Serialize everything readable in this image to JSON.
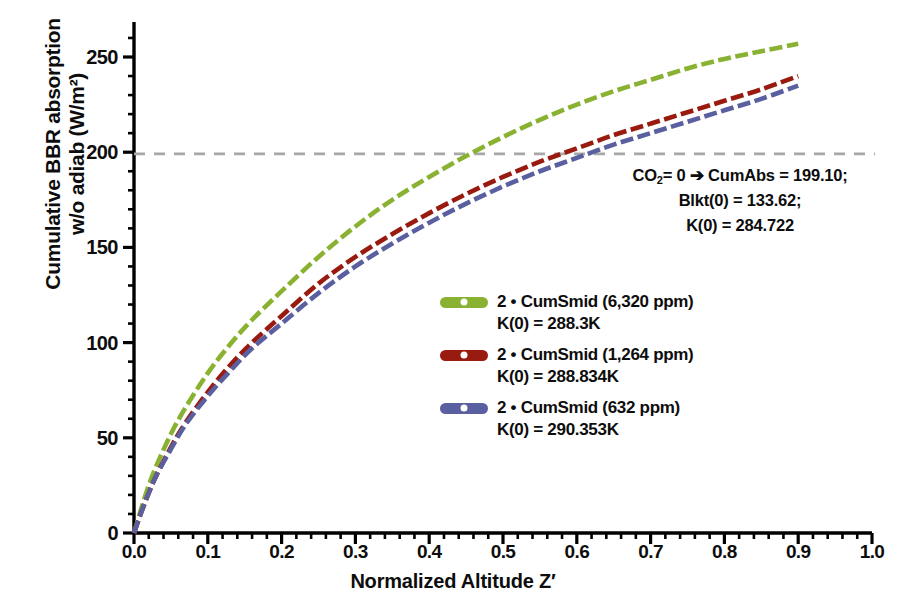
{
  "chart_data": {
    "type": "line",
    "title": "",
    "xlabel": "Normalized Altitude Z′",
    "ylabel_line1": "Cumulative BBR absorption",
    "ylabel_line2": "w/o adiab (W/m²)",
    "xlim": [
      0.0,
      1.0
    ],
    "ylim": [
      0,
      262
    ],
    "grid": false,
    "legend_position": "center",
    "xticks": [
      "0.0",
      "0.1",
      "0.2",
      "0.3",
      "0.4",
      "0.5",
      "0.6",
      "0.7",
      "0.8",
      "0.9",
      "1.0"
    ],
    "xtick_values": [
      0.0,
      0.1,
      0.2,
      0.3,
      0.4,
      0.5,
      0.6,
      0.7,
      0.8,
      0.9,
      1.0
    ],
    "yticks": [
      "0",
      "50",
      "100",
      "150",
      "200",
      "250"
    ],
    "ytick_values": [
      0,
      50,
      100,
      150,
      200,
      250
    ],
    "x": [
      0.0,
      0.01,
      0.02,
      0.03,
      0.05,
      0.07,
      0.1,
      0.13,
      0.16,
      0.2,
      0.25,
      0.3,
      0.35,
      0.4,
      0.45,
      0.5,
      0.55,
      0.6,
      0.65,
      0.7,
      0.75,
      0.8,
      0.85,
      0.9
    ],
    "series": [
      {
        "name": "2 • CumSmid (6,320 ppm)",
        "sublabel": "K(0) = 288.3K",
        "color": "#8ab232",
        "style": "dashed",
        "values": [
          0,
          13,
          25,
          35,
          52,
          66,
          84,
          99,
          112,
          127,
          145,
          161,
          175,
          187,
          198,
          208,
          217,
          225,
          232,
          238,
          244,
          249,
          253,
          257
        ]
      },
      {
        "name": "2 • CumSmid (1,264 ppm)",
        "sublabel": "K(0) = 288.834K",
        "color": "#991b10",
        "style": "dashed",
        "values": [
          0,
          11,
          21,
          30,
          45,
          58,
          74,
          88,
          100,
          114,
          131,
          145,
          157,
          168,
          178,
          187,
          195,
          202,
          209,
          215,
          221,
          227,
          233,
          240
        ]
      },
      {
        "name": "2 • CumSmid (632 ppm)",
        "sublabel": "K(0) = 290.353K",
        "color": "#5a5fa0",
        "style": "dashed",
        "values": [
          0,
          11,
          21,
          30,
          44,
          57,
          72,
          85,
          97,
          110,
          126,
          140,
          152,
          163,
          173,
          182,
          190,
          197,
          204,
          210,
          216,
          222,
          228,
          235
        ]
      }
    ],
    "reference_line": {
      "value": 199.1,
      "color": "#a8a8a8",
      "style": "dashed",
      "orientation": "horizontal"
    },
    "annotation": {
      "line1_pre": "CO",
      "line1_sub": "2",
      "line1_post": "= 0 ➔ CumAbs = 199.10;",
      "line2": "Blkt(0) = 133.62;",
      "line3": "K(0) = 284.722"
    }
  }
}
